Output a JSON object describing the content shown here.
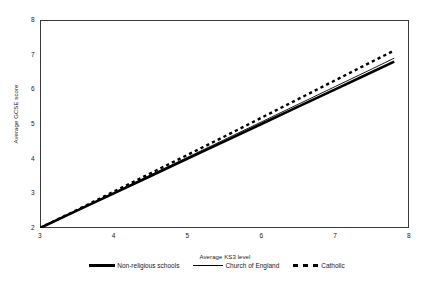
{
  "chart_data": {
    "type": "line",
    "title": "",
    "xlabel": "Average KS3 level",
    "ylabel": "Average GCSE score",
    "xlim": [
      3,
      8
    ],
    "ylim": [
      2,
      8
    ],
    "xticks": [
      "3",
      "4",
      "5",
      "6",
      "7",
      "8"
    ],
    "yticks": [
      "2",
      "3",
      "4",
      "5",
      "6",
      "7",
      "8"
    ],
    "grid": false,
    "legend_position": "bottom",
    "x": [
      3.0,
      3.5,
      4.0,
      4.5,
      5.0,
      5.5,
      6.0,
      6.5,
      7.0,
      7.5,
      7.8
    ],
    "series": [
      {
        "name": "Non-religious schools",
        "style": "solid-thick",
        "color": "#000000",
        "values": [
          2.0,
          2.5,
          3.0,
          3.5,
          4.0,
          4.5,
          5.0,
          5.5,
          6.0,
          6.5,
          6.8
        ]
      },
      {
        "name": "Church of England",
        "style": "solid-thin",
        "color": "#000000",
        "values": [
          2.0,
          2.51,
          3.02,
          3.53,
          4.04,
          4.55,
          5.06,
          5.57,
          6.08,
          6.59,
          6.9
        ]
      },
      {
        "name": "Catholic",
        "style": "dashed",
        "color": "#000000",
        "values": [
          2.0,
          2.52,
          3.05,
          3.58,
          4.11,
          4.64,
          5.18,
          5.72,
          6.26,
          6.8,
          7.12
        ]
      }
    ]
  },
  "legend": {
    "items": [
      {
        "label": "Non-religious schools"
      },
      {
        "label": "Church of England"
      },
      {
        "label": "Catholic"
      }
    ]
  }
}
